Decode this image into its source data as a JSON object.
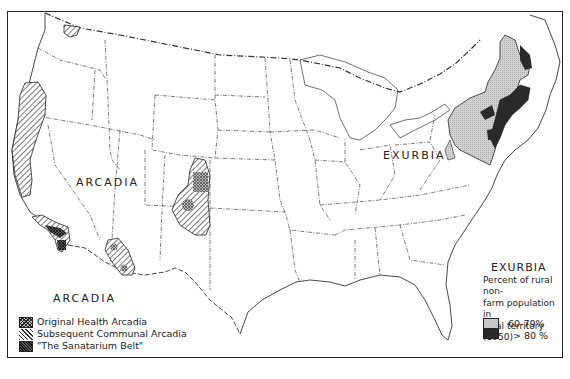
{
  "map": {
    "subject": "United States regions of rural non-farm settlement",
    "labels": {
      "arcadia_west": "ARCADIA",
      "arcadia_legend_heading": "ARCADIA",
      "exurbia_map": "EXURBIA"
    },
    "arcadia_legend": {
      "heading": "ARCADIA",
      "items": [
        {
          "label": "Original Health Arcadia",
          "pattern": "crosshatch"
        },
        {
          "label": "Subsequent Communal Arcadia",
          "pattern": "diagonal-hatch"
        },
        {
          "label": "\"The Sanatarium Belt\"",
          "pattern": "dense-dark-crosshatch"
        }
      ]
    },
    "exurbia_legend": {
      "heading": "EXURBIA",
      "description": "Percent of rural non-farm population in rural territory (1950)",
      "description_lines": [
        "Percent of rural non-",
        "farm population in",
        "rural territory (1950)"
      ],
      "items": [
        {
          "label": "60-79%",
          "color": "#c8c8c8"
        },
        {
          "label": "> 80 %",
          "color": "#2a2a2a"
        }
      ]
    },
    "colors": {
      "border": "#222222",
      "light_shade": "#c8c8c8",
      "dark_shade": "#2a2a2a",
      "background": "#ffffff"
    }
  }
}
